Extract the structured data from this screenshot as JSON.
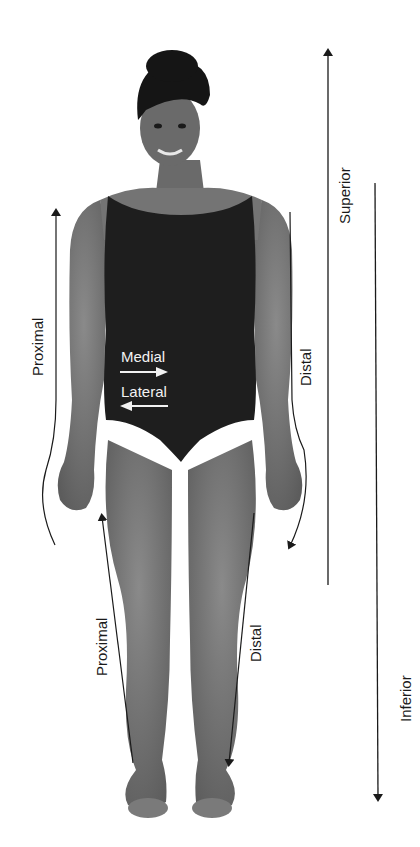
{
  "diagram": {
    "labels": {
      "superior": "Superior",
      "inferior": "Inferior",
      "proximal_arm": "Proximal",
      "distal_arm": "Distal",
      "proximal_leg": "Proximal",
      "distal_leg": "Distal",
      "medial": "Medial",
      "lateral": "Lateral"
    },
    "arrows": [
      {
        "name": "superior-arrow",
        "direction": "up"
      },
      {
        "name": "inferior-arrow",
        "direction": "down"
      },
      {
        "name": "proximal-arm-arrow",
        "direction": "up"
      },
      {
        "name": "distal-arm-arrow",
        "direction": "down"
      },
      {
        "name": "proximal-leg-arrow",
        "direction": "up"
      },
      {
        "name": "distal-leg-arrow",
        "direction": "down"
      },
      {
        "name": "medial-arrow",
        "direction": "right"
      },
      {
        "name": "lateral-arrow",
        "direction": "left"
      }
    ],
    "colors": {
      "background": "#ffffff",
      "skin": "#6e6e6e",
      "leotard": "#1e1e1e",
      "line": "#1a1a1a",
      "inner_label": "#f2f2f2"
    }
  }
}
